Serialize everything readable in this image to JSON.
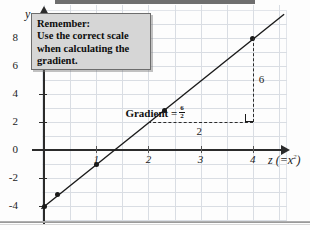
{
  "chart_data": {
    "type": "line",
    "title": "",
    "xlabel": "z  (= x²)",
    "ylabel": "y",
    "xlim": [
      -0.25,
      4.75
    ],
    "ylim": [
      -5,
      9
    ],
    "grid": true,
    "legend": false,
    "x_ticks": [
      "1",
      "2",
      "3",
      "4"
    ],
    "x_tick_values": [
      1,
      2,
      3,
      4
    ],
    "y_ticks": [
      "8",
      "6",
      "4",
      "2",
      "0",
      "-2",
      "-4"
    ],
    "y_tick_values": [
      8,
      6,
      4,
      2,
      0,
      -2,
      -4
    ],
    "series": [
      {
        "name": "line of best fit",
        "points": [
          {
            "x": 0.0,
            "y": -4.0
          },
          {
            "x": 0.25,
            "y": -3.2
          },
          {
            "x": 1.0,
            "y": -1.0
          },
          {
            "x": 2.3,
            "y": 2.8
          },
          {
            "x": 4.0,
            "y": 8.0
          }
        ]
      }
    ],
    "line_endpoints": {
      "x1": -0.05,
      "y1": -4.2,
      "x2": 4.6,
      "y2": 9.7
    },
    "annotations": {
      "gradient_label": "Gradient =",
      "gradient_numerator": "6",
      "gradient_denominator": "2",
      "rise_label": "6",
      "run_label": "2",
      "triangle": {
        "x_start": 2.0,
        "x_end": 4.0,
        "y_base": 2.0,
        "y_top": 8.0
      }
    }
  },
  "callout": {
    "name": "remember-note",
    "lines": [
      "Remember:",
      "Use the correct scale",
      "when calculating the",
      "gradient."
    ]
  },
  "axis_labels": {
    "y": "y",
    "x_var": "z",
    "x_expr_open": "(=",
    "x_expr_base": "x",
    "x_expr_exp": "2",
    "x_expr_close": ")"
  },
  "colors": {
    "ink": "#1a1a1a",
    "axis": "#2b2b2b",
    "grid": "#d9dde3",
    "callout_fill": "#d6d6d6",
    "callout_border": "#6d6d6d",
    "page": "#fdfdfd"
  }
}
